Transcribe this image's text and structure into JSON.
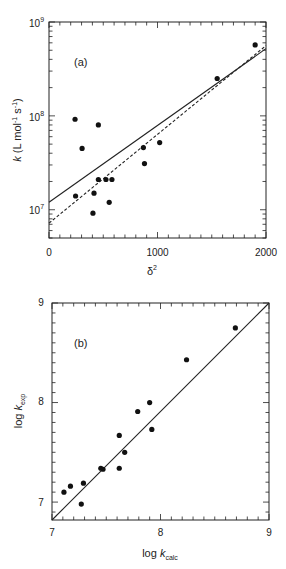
{
  "chart_data": [
    {
      "panel_label": "(a)",
      "type": "scatter",
      "title": "",
      "xlabel": "δ²",
      "ylabel": "k (L mol⁻¹ s⁻¹)",
      "xlim": [
        0,
        2000
      ],
      "ylim": [
        5000000,
        1000000000
      ],
      "yscale": "log",
      "grid": false,
      "x_ticks": [
        0,
        1000,
        2000
      ],
      "x_tick_labels": [
        "0",
        "1000",
        "2000"
      ],
      "y_ticks": [
        10000000,
        100000000,
        1000000000
      ],
      "y_tick_labels": [
        "10⁷",
        "10⁸",
        "10⁹"
      ],
      "points": [
        {
          "x": 240,
          "y": 92000000
        },
        {
          "x": 305,
          "y": 45000000
        },
        {
          "x": 455,
          "y": 80000000
        },
        {
          "x": 245,
          "y": 14000000
        },
        {
          "x": 415,
          "y": 15000000
        },
        {
          "x": 455,
          "y": 21000000
        },
        {
          "x": 525,
          "y": 21000000
        },
        {
          "x": 580,
          "y": 21000000
        },
        {
          "x": 555,
          "y": 12000000
        },
        {
          "x": 405,
          "y": 9200000
        },
        {
          "x": 870,
          "y": 46000000
        },
        {
          "x": 880,
          "y": 31000000
        },
        {
          "x": 1020,
          "y": 52000000
        },
        {
          "x": 1550,
          "y": 250000000
        },
        {
          "x": 1900,
          "y": 570000000
        }
      ],
      "series": [
        {
          "name": "solid fit",
          "style": "solid",
          "x": [
            0,
            2000
          ],
          "y": [
            12000000,
            520000000
          ]
        },
        {
          "name": "dashed fit",
          "style": "dashed",
          "x": [
            0,
            2000
          ],
          "y": [
            7200000,
            560000000
          ]
        }
      ]
    },
    {
      "panel_label": "(b)",
      "type": "scatter",
      "title": "",
      "xlabel": "log k_calc",
      "ylabel": "log k_exp",
      "xlim": [
        7,
        9
      ],
      "ylim": [
        6.82,
        9
      ],
      "grid": false,
      "x_ticks": [
        7,
        8,
        9
      ],
      "x_tick_labels": [
        "7",
        "8",
        "9"
      ],
      "y_ticks": [
        7,
        8,
        9
      ],
      "y_tick_labels": [
        "7",
        "8",
        "9"
      ],
      "points": [
        {
          "x": 7.11,
          "y": 7.1
        },
        {
          "x": 7.17,
          "y": 7.16
        },
        {
          "x": 7.27,
          "y": 6.98
        },
        {
          "x": 7.29,
          "y": 7.19
        },
        {
          "x": 7.45,
          "y": 7.34
        },
        {
          "x": 7.47,
          "y": 7.33
        },
        {
          "x": 7.62,
          "y": 7.34
        },
        {
          "x": 7.62,
          "y": 7.67
        },
        {
          "x": 7.67,
          "y": 7.5
        },
        {
          "x": 7.79,
          "y": 7.91
        },
        {
          "x": 7.9,
          "y": 8.0
        },
        {
          "x": 7.92,
          "y": 7.73
        },
        {
          "x": 8.24,
          "y": 8.43
        },
        {
          "x": 8.69,
          "y": 8.75
        }
      ],
      "series": [
        {
          "name": "y = x",
          "style": "solid",
          "x": [
            7,
            9
          ],
          "y": [
            6.82,
            9
          ]
        }
      ]
    }
  ],
  "labels": {
    "panel_a": "(a)",
    "panel_b": "(b)",
    "a_xlabel": "δ",
    "a_xlabel_sup": "2",
    "a_ylabel_k": "k",
    "a_ylabel_units": "(L mol",
    "a_ylabel_exp1": "-1",
    "a_ylabel_s": " s",
    "a_ylabel_exp2": "-1",
    "a_ylabel_close": ")",
    "b_xlabel_log": "log ",
    "b_xlabel_k": "k",
    "b_xlabel_sub": "calc",
    "b_ylabel_log": "log ",
    "b_ylabel_k": "k",
    "b_ylabel_sub": "exp",
    "a_xt0": "0",
    "a_xt1": "1000",
    "a_xt2": "2000",
    "a_yt7": "10",
    "a_yt7_sup": "7",
    "a_yt8": "10",
    "a_yt8_sup": "8",
    "a_yt9": "10",
    "a_yt9_sup": "9",
    "b_xt7": "7",
    "b_xt8": "8",
    "b_xt9": "9",
    "b_yt7": "7",
    "b_yt8": "8",
    "b_yt9": "9"
  }
}
